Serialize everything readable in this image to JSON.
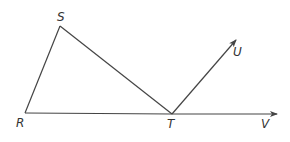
{
  "diagram": {
    "type": "geometry",
    "colors": {
      "line": "#444444",
      "label": "#333333",
      "background": "#ffffff"
    },
    "points": [
      {
        "id": "S",
        "label": "S",
        "x": 60,
        "y": 26
      },
      {
        "id": "R",
        "label": "R",
        "x": 25,
        "y": 113
      },
      {
        "id": "T",
        "label": "T",
        "x": 172,
        "y": 114
      },
      {
        "id": "U",
        "label": "U",
        "x": 236,
        "y": 40
      },
      {
        "id": "V",
        "label": "V",
        "x": 277,
        "y": 114
      }
    ],
    "segments": [
      "RS",
      "ST",
      "RT"
    ],
    "rays": [
      "TU",
      "TV"
    ]
  },
  "labels": {
    "S": "S",
    "R": "R",
    "T": "T",
    "U": "U",
    "V": "V"
  }
}
